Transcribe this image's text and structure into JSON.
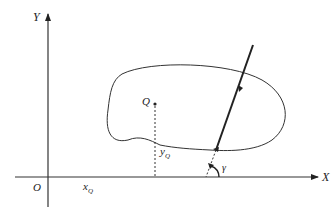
{
  "diagram": {
    "axes": {
      "x_label": "X",
      "y_label": "Y",
      "origin_label": "O"
    },
    "point": {
      "label": "Q",
      "x_coord_label": "x",
      "x_coord_sub": "Q",
      "y_coord_label": "y",
      "y_coord_sub": "Q"
    },
    "angle": {
      "label": "γ"
    },
    "colors": {
      "stroke": "#222222",
      "background": "#ffffff"
    }
  }
}
